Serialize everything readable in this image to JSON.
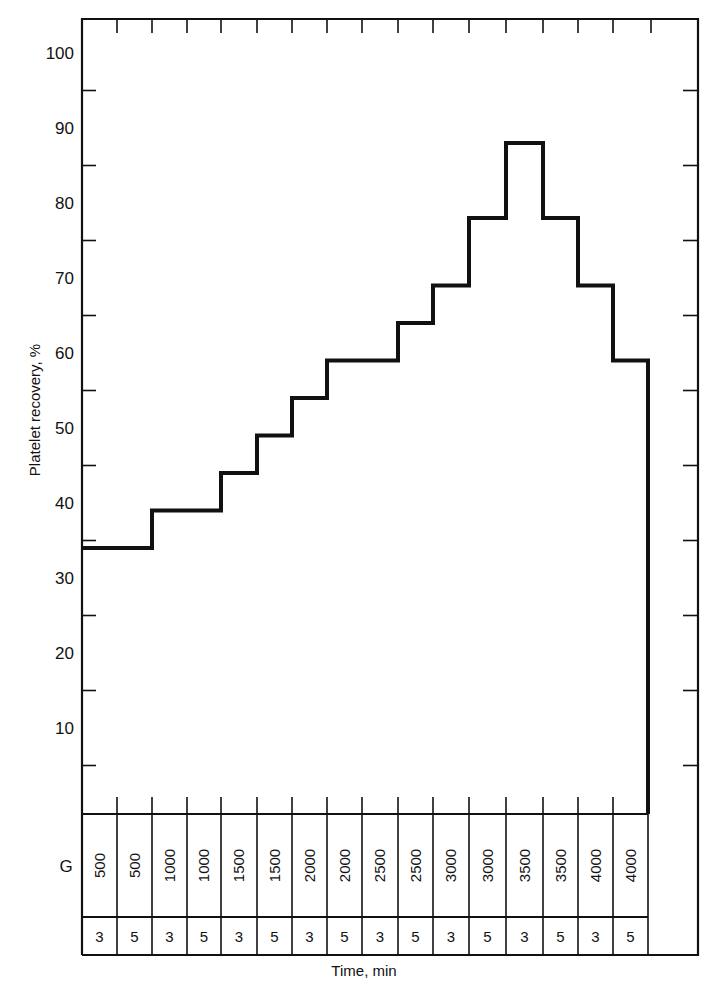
{
  "chart_data": {
    "type": "step",
    "title": "",
    "xlabel": "Time, min",
    "ylabel": "Platelet recovery, %",
    "ylim": [
      0,
      105
    ],
    "yticks_labeled": [
      10,
      20,
      30,
      40,
      50,
      60,
      70,
      80,
      90,
      100
    ],
    "yticks_minor": [
      5,
      15,
      25,
      35,
      45,
      55,
      65,
      75,
      85,
      95
    ],
    "grid": false,
    "legend": null,
    "table_row_labels": [
      "G",
      ""
    ],
    "categories_G": [
      "500",
      "500",
      "1000",
      "1000",
      "1500",
      "1500",
      "2000",
      "2000",
      "2500",
      "2500",
      "3000",
      "3000",
      "3500",
      "3500",
      "4000",
      "4000"
    ],
    "categories_time_min": [
      "3",
      "5",
      "3",
      "5",
      "3",
      "5",
      "3",
      "5",
      "3",
      "5",
      "3",
      "5",
      "3",
      "5",
      "3",
      "5"
    ],
    "series": [
      {
        "name": "Platelet recovery",
        "values": [
          34,
          34,
          39,
          39,
          44,
          49,
          54,
          59,
          59,
          64,
          69,
          78,
          88,
          78,
          69,
          59
        ]
      }
    ]
  },
  "labels": {
    "ylabel": "Platelet recovery, %",
    "xlabel": "Time, min",
    "g_row_label": "G"
  }
}
